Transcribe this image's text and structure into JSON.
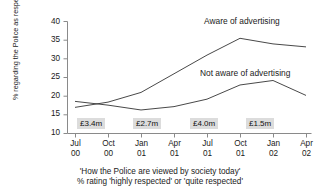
{
  "chart_data": {
    "type": "line",
    "title": "",
    "xlabel": "",
    "ylabel": "% regarding the Police as respected",
    "ylim": [
      10,
      40
    ],
    "yticks": [
      10,
      15,
      20,
      25,
      30,
      35,
      40
    ],
    "grid": false,
    "legend_position": "inline-annotations",
    "categories": [
      "Jul 00",
      "Oct 00",
      "Jan 01",
      "Apr 01",
      "Jul 01",
      "Oct 01",
      "Jan 02",
      "Apr 02"
    ],
    "x_tick_labels": [
      {
        "month": "Jul",
        "year": "00"
      },
      {
        "month": "Oct",
        "year": "00"
      },
      {
        "month": "Jan",
        "year": "01"
      },
      {
        "month": "Apr",
        "year": "01"
      },
      {
        "month": "Jul",
        "year": "01"
      },
      {
        "month": "Oct",
        "year": "01"
      },
      {
        "month": "Jan",
        "year": "02"
      },
      {
        "month": "Apr",
        "year": "02"
      }
    ],
    "series": [
      {
        "name": "Aware of advertising",
        "values": [
          17.0,
          18.4,
          21.0,
          26.0,
          31.0,
          35.5,
          34.0,
          33.2
        ],
        "color": "#333333"
      },
      {
        "name": "Not aware of advertising",
        "values": [
          18.6,
          17.6,
          16.3,
          17.2,
          19.2,
          23.0,
          24.2,
          20.2
        ],
        "color": "#333333"
      }
    ],
    "annotations": [
      {
        "name": "spend-3-4m",
        "label": "£3.4m",
        "at_category_index": 1
      },
      {
        "name": "spend-2-7m",
        "label": "£2.7m",
        "at_category_index": 2.7
      },
      {
        "name": "spend-4-0m",
        "label": "£4.0m",
        "at_category_index": 4.4
      },
      {
        "name": "spend-1-5m",
        "label": "£1.5m",
        "at_category_index": 5.7
      }
    ],
    "caption_lines": [
      "'How the Police are viewed by society today'",
      "% rating 'highly respected' or 'quite respected'"
    ]
  },
  "axis": {
    "y_tick_40": "40",
    "y_tick_35": "35",
    "y_tick_30": "30",
    "y_tick_25": "25",
    "y_tick_20": "20",
    "y_tick_15": "15",
    "y_tick_10": "10",
    "y_title": "% regarding the Police as respected"
  },
  "x_labels": {
    "t0_month": "Jul",
    "t0_year": "00",
    "t1_month": "Oct",
    "t1_year": "00",
    "t2_month": "Jan",
    "t2_year": "01",
    "t3_month": "Apr",
    "t3_year": "01",
    "t4_month": "Jul",
    "t4_year": "01",
    "t5_month": "Oct",
    "t5_year": "01",
    "t6_month": "Jan",
    "t6_year": "02",
    "t7_month": "Apr",
    "t7_year": "02"
  },
  "spend": {
    "box1": "£3.4m",
    "box2": "£2.7m",
    "box3": "£4.0m",
    "box4": "£1.5m"
  },
  "series_labels": {
    "aware": "Aware of advertising",
    "not_aware": "Not aware of advertising"
  },
  "caption": {
    "line1": "'How the Police are viewed by society today'",
    "line2": "% rating 'highly respected' or 'quite respected'"
  },
  "colors": {
    "line": "#333333",
    "axis": "#888888",
    "spend_box_bg": "#dcdcdc",
    "text": "#1a1a1a"
  }
}
